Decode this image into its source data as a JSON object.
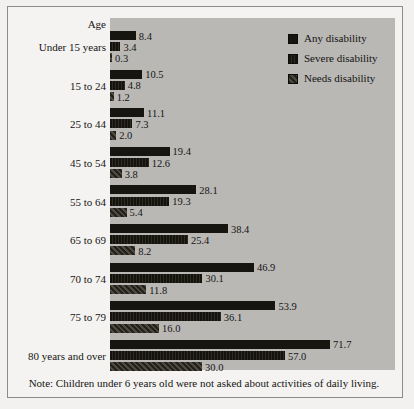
{
  "figure": {
    "axis_header": "Age",
    "note": "Note: Children under 6 years old were not asked about activities of daily living.",
    "panel_color": "#b9b8b5",
    "page_color": "#f2f1ef"
  },
  "legend": {
    "position": "top-right",
    "items": [
      {
        "label": "Any disability",
        "color": "#17150f"
      },
      {
        "label": "Severe disability",
        "color": "#211f18"
      },
      {
        "label": "Needs disability",
        "color": "#3a382f"
      }
    ]
  },
  "chart_data": {
    "type": "bar",
    "orientation": "horizontal",
    "title": "",
    "subtitle": "",
    "xlabel": "",
    "ylabel": "Age",
    "xlim": [
      0,
      80
    ],
    "grid": false,
    "legend_position": "top-right",
    "categories": [
      "Under 15 years",
      "15 to 24",
      "25 to 44",
      "45 to 54",
      "55 to 64",
      "65 to 69",
      "70 to 74",
      "75 to 79",
      "80 years and over"
    ],
    "series": [
      {
        "name": "Any disability",
        "color": "#17150f",
        "values": [
          8.4,
          10.5,
          11.1,
          19.4,
          28.1,
          38.4,
          46.9,
          53.9,
          71.7
        ]
      },
      {
        "name": "Severe disability",
        "color": "#211f18",
        "values": [
          3.4,
          4.8,
          7.3,
          12.6,
          19.3,
          25.4,
          30.1,
          36.1,
          57.0
        ]
      },
      {
        "name": "Needs disability",
        "color": "#3a382f",
        "values": [
          0.3,
          1.2,
          2.0,
          3.8,
          5.4,
          8.2,
          11.8,
          16.0,
          30.0
        ]
      }
    ],
    "data_labels": [
      [
        "8.4",
        "3.4",
        "0.3"
      ],
      [
        "10.5",
        "4.8",
        "1.2"
      ],
      [
        "11.1",
        "7.3",
        "2.0"
      ],
      [
        "19.4",
        "12.6",
        "3.8"
      ],
      [
        "28.1",
        "19.3",
        "5.4"
      ],
      [
        "38.4",
        "25.4",
        "8.2"
      ],
      [
        "46.9",
        "30.1",
        "11.8"
      ],
      [
        "53.9",
        "36.1",
        "16.0"
      ],
      [
        "71.7",
        "57.0",
        "30.0"
      ]
    ],
    "annotations": [
      "Note: Children under 6 years old were not asked about activities of daily living."
    ]
  }
}
